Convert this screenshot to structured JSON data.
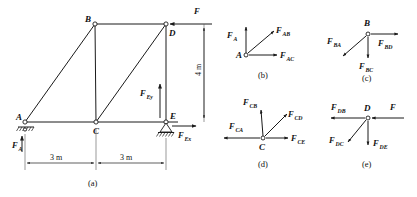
{
  "figure": {
    "panels": [
      {
        "id": "a",
        "label": "(a)"
      },
      {
        "id": "b",
        "label": "(b)"
      },
      {
        "id": "c",
        "label": "(c)"
      },
      {
        "id": "d",
        "label": "(d)"
      },
      {
        "id": "e",
        "label": "(e)"
      }
    ]
  },
  "truss": {
    "nodes": [
      {
        "name": "A",
        "label": "A"
      },
      {
        "name": "B",
        "label": "B"
      },
      {
        "name": "C",
        "label": "C"
      },
      {
        "name": "D",
        "label": "D"
      },
      {
        "name": "E",
        "label": "E"
      }
    ],
    "dimensions": [
      {
        "name": "span-ac",
        "label": "3 m"
      },
      {
        "name": "span-ce",
        "label": "3 m"
      },
      {
        "name": "height-de",
        "label": "4 m"
      }
    ],
    "forces": [
      {
        "name": "applied-load-F",
        "base": "F",
        "sub": ""
      },
      {
        "name": "reaction-FA",
        "base": "F",
        "sub": "A"
      },
      {
        "name": "reaction-FEy",
        "base": "F",
        "sub": "Ey"
      },
      {
        "name": "reaction-FEx",
        "base": "F",
        "sub": "Ex"
      }
    ]
  },
  "joint_b_panel": {
    "node": "A",
    "forces": [
      {
        "name": "FA",
        "base": "F",
        "sub": "A"
      },
      {
        "name": "FAB",
        "base": "F",
        "sub": "AB"
      },
      {
        "name": "FAC",
        "base": "F",
        "sub": "AC"
      }
    ]
  },
  "joint_c_panel": {
    "node": "B",
    "forces": [
      {
        "name": "FBA",
        "base": "F",
        "sub": "BA"
      },
      {
        "name": "FBD",
        "base": "F",
        "sub": "BD"
      },
      {
        "name": "FBC",
        "base": "F",
        "sub": "BC"
      }
    ]
  },
  "joint_d_panel": {
    "node": "C",
    "forces": [
      {
        "name": "FCB",
        "base": "F",
        "sub": "CB"
      },
      {
        "name": "FCD",
        "base": "F",
        "sub": "CD"
      },
      {
        "name": "FCA",
        "base": "F",
        "sub": "CA"
      },
      {
        "name": "FCE",
        "base": "F",
        "sub": "CE"
      }
    ]
  },
  "joint_e_panel": {
    "node": "D",
    "forces": [
      {
        "name": "FDB",
        "base": "F",
        "sub": "DB"
      },
      {
        "name": "F",
        "base": "F",
        "sub": ""
      },
      {
        "name": "FDC",
        "base": "F",
        "sub": "DC"
      },
      {
        "name": "FDE",
        "base": "F",
        "sub": "DE"
      }
    ]
  },
  "colors": {
    "ink": "#1a1a1a",
    "paper": "#ffffff"
  }
}
